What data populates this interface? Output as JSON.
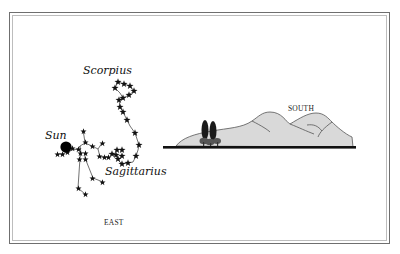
{
  "diagram": {
    "labels": {
      "scorpius": "Scorpius",
      "sun": "Sun",
      "sagittarius": "Sagittarius",
      "south": "SOUTH",
      "east": "EAST"
    },
    "colors": {
      "frame_outer": "#6f6f6f",
      "frame_inner": "#bdbdbd",
      "stars": "#111111",
      "constellation_lines": "#333333",
      "sun": "#000000",
      "hills_fill": "#d9d9d9",
      "hills_stroke": "#555555",
      "horizon": "#111111",
      "trees": "#222222"
    }
  }
}
